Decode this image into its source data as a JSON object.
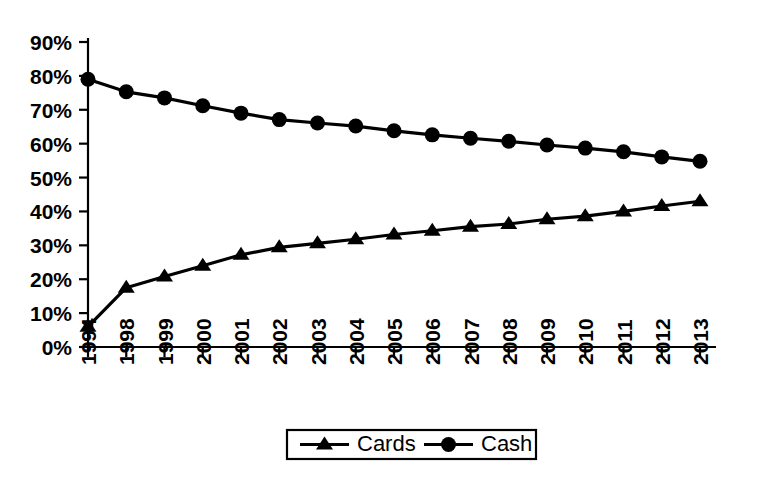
{
  "chart_data": {
    "type": "line",
    "title": "",
    "subtitle": "",
    "xlabel": "",
    "ylabel": "",
    "categories": [
      "1994",
      "1998",
      "1999",
      "2000",
      "2001",
      "2002",
      "2003",
      "2004",
      "2005",
      "2006",
      "2007",
      "2008",
      "2009",
      "2010",
      "2011",
      "2012",
      "2013"
    ],
    "series": [
      {
        "name": "Cards",
        "marker": "triangle",
        "color": "#000000",
        "values": [
          6,
          17.5,
          20.8,
          24,
          27.2,
          29.4,
          30.6,
          31.8,
          33.2,
          34.3,
          35.5,
          36.3,
          37.7,
          38.6,
          40,
          41.6,
          43
        ]
      },
      {
        "name": "Cash",
        "marker": "circle",
        "color": "#000000",
        "values": [
          79,
          75.3,
          73.5,
          71.2,
          69,
          67.1,
          66.1,
          65.2,
          63.8,
          62.6,
          61.6,
          60.7,
          59.6,
          58.7,
          57.6,
          56.1,
          54.8
        ]
      }
    ],
    "ylim": [
      0,
      90
    ],
    "ytick_step": 10,
    "ytick_labels": [
      "0%",
      "10%",
      "20%",
      "30%",
      "40%",
      "50%",
      "60%",
      "70%",
      "80%",
      "90%"
    ],
    "grid": false,
    "legend_position": "bottom-center",
    "legend_entries": [
      "Cards",
      "Cash"
    ],
    "value_unit": "%",
    "xtick_label_rotation": -90
  },
  "colors": {
    "background": "#ffffff",
    "foreground": "#000000",
    "series": "#000000"
  }
}
